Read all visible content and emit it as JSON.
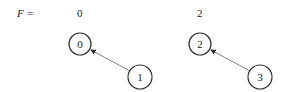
{
  "diagram": {
    "array_label": "F =",
    "array_values": [
      "0",
      "2"
    ],
    "trees": [
      {
        "root": {
          "label": "0",
          "cx": 80,
          "cy": 44
        },
        "child": {
          "label": "1",
          "cx": 140,
          "cy": 77
        }
      },
      {
        "root": {
          "label": "2",
          "cx": 200,
          "cy": 44
        },
        "child": {
          "label": "3",
          "cx": 260,
          "cy": 77
        }
      }
    ],
    "colors": {
      "stroke": "#333333",
      "edge": "#777777"
    }
  }
}
